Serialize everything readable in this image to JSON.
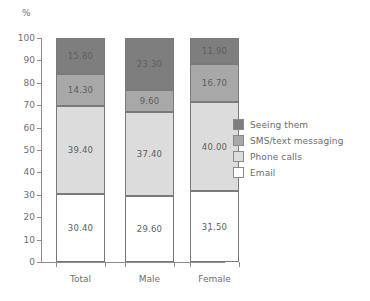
{
  "chart_data": {
    "type": "bar",
    "subtype": "stacked-bar-100",
    "title": "",
    "xlabel": "",
    "ylabel": "",
    "unit_label": "%",
    "categories": [
      "Total",
      "Male",
      "Female"
    ],
    "series": [
      {
        "name": "Email",
        "values": [
          30.4,
          29.6,
          31.5
        ],
        "color": "#ffffff"
      },
      {
        "name": "Phone calls",
        "values": [
          39.4,
          37.4,
          40.0
        ],
        "color": "#dcdcdc"
      },
      {
        "name": "SMS/text messaging",
        "values": [
          14.3,
          9.6,
          16.7
        ],
        "color": "#a8a8a8"
      },
      {
        "name": "Seeing them",
        "values": [
          15.8,
          23.3,
          11.9
        ],
        "color": "#7e7e7e"
      }
    ],
    "stack_order_bottom_to_top": [
      "Email",
      "Phone calls",
      "SMS/text messaging",
      "Seeing them"
    ],
    "value_labels": {
      "Total": {
        "Seeing them": "15.80",
        "SMS/text messaging": "14.30",
        "Phone calls": "39.40",
        "Email": "30.40"
      },
      "Male": {
        "Seeing them": "23.30",
        "SMS/text messaging": "9.60",
        "Phone calls": "37.40",
        "Email": "29.60"
      },
      "Female": {
        "Seeing them": "11.90",
        "SMS/text messaging": "16.70",
        "Phone calls": "40.00",
        "Email": "31.50"
      }
    },
    "ylim": [
      0,
      100
    ],
    "ytick_step": 10,
    "yticks": [
      "100",
      "90",
      "80",
      "70",
      "60",
      "50",
      "40",
      "30",
      "20",
      "10",
      "0"
    ],
    "grid": false,
    "legend_position": "right"
  },
  "legend": {
    "items": [
      {
        "label": "Seeing them",
        "color": "#7e7e7e"
      },
      {
        "label": "SMS/text messaging",
        "color": "#a8a8a8"
      },
      {
        "label": "Phone calls",
        "color": "#dcdcdc"
      },
      {
        "label": "Email",
        "color": "#ffffff"
      }
    ]
  }
}
